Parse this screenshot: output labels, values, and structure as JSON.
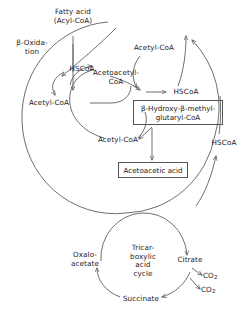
{
  "diagram": {
    "background_color": "#ffffff",
    "stroke_color": "#555555",
    "text_color": "#1a1a1a"
  },
  "labels": {
    "fatty_acid_line1": "Fatty acid",
    "fatty_acid_line2": "(Acyl-CoA)",
    "beta_oxidation_line1": "β-Oxida-",
    "beta_oxidation_line2": "tion",
    "hscoa_left": "HSCoA",
    "acetyl_coa_left": "Acetyl-CoA",
    "acetoacetyl_coa_line1": "Acetoacetyl-",
    "acetoacetyl_coa_line2": "CoA",
    "acetyl_coa_top": "Acetyl-CoA",
    "hscoa_mid": "HSCoA",
    "acetyl_coa_center": "Acetyl-CoA",
    "hscoa_right": "HSCoA",
    "hmg_coa_line1": "β-Hydroxy-β-methyl-",
    "hmg_coa_line2": "glutaryl-CoA",
    "acetoacetic_acid": "Acetoacetic acid"
  },
  "tca_cycle": {
    "center_line1": "Tricar-",
    "center_line2": "boxylic",
    "center_line3": "acid",
    "center_line4": "cycle",
    "oxaloacetate_line1": "Oxalo-",
    "oxaloacetate_line2": "acetate",
    "citrate": "Citrate",
    "succinate": "Succinate",
    "co2_upper": "CO",
    "co2_upper_sub": "2",
    "co2_lower": "CO",
    "co2_lower_sub": "2"
  }
}
